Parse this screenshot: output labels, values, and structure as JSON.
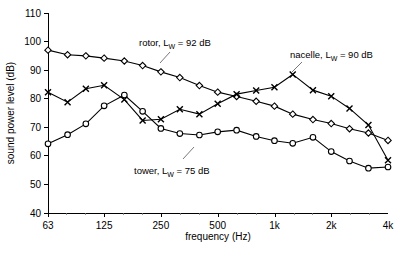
{
  "chart_data": {
    "type": "line",
    "title": "",
    "xlabel": "frequency (Hz)",
    "ylabel": "sound power level (dB)",
    "xscale": "log",
    "xlim": [
      63,
      4000
    ],
    "ylim": [
      40,
      110
    ],
    "grid": false,
    "legend_position": "inline-annotations",
    "xtick_labels": [
      "63",
      "125",
      "250",
      "500",
      "1k",
      "2k",
      "4k"
    ],
    "xtick_values": [
      63,
      125,
      250,
      500,
      1000,
      2000,
      4000
    ],
    "ytick_labels": [
      "40",
      "50",
      "60",
      "70",
      "80",
      "90",
      "100",
      "110"
    ],
    "ytick_values": [
      40,
      50,
      60,
      70,
      80,
      90,
      100,
      110
    ],
    "x": [
      63,
      80,
      100,
      125,
      160,
      200,
      250,
      315,
      400,
      500,
      630,
      800,
      1000,
      1250,
      1600,
      2000,
      2500,
      3150,
      4000
    ],
    "series": [
      {
        "name": "rotor",
        "marker": "diamond",
        "label": "rotor, L",
        "label_sub": "W",
        "label_tail": " = 92 dB",
        "lw_db": 92,
        "values": [
          97.0,
          95.4,
          95.0,
          94.2,
          93.2,
          91.6,
          89.4,
          87.4,
          84.6,
          82.3,
          80.8,
          79.1,
          77.4,
          74.6,
          72.7,
          71.3,
          69.5,
          68.0,
          65.4
        ]
      },
      {
        "name": "nacelle",
        "marker": "x",
        "label": "nacelle, L",
        "label_sub": "W",
        "label_tail": " = 90 dB",
        "lw_db": 90,
        "values": [
          82.3,
          78.8,
          83.5,
          84.7,
          79.7,
          72.4,
          72.8,
          76.3,
          74.6,
          78.2,
          81.6,
          82.9,
          84.0,
          88.5,
          83.0,
          80.9,
          76.6,
          70.8,
          58.5
        ]
      },
      {
        "name": "tower",
        "marker": "circle",
        "label": "tower, L",
        "label_sub": "W",
        "label_tail": " = 75 dB",
        "lw_db": 75,
        "values": [
          64.2,
          67.4,
          71.2,
          77.5,
          81.3,
          75.6,
          69.6,
          67.8,
          67.3,
          68.4,
          69.0,
          66.8,
          65.3,
          64.4,
          65.8,
          69.3,
          66.5,
          64.4,
          64.6
        ]
      }
    ],
    "series_extra_note": "tower extends to 4k with additional declining tail",
    "tower_tail_x": [
      1600,
      2000,
      2500,
      3150,
      4000
    ],
    "tower_tail_values": [
      66.5,
      61.5,
      58.2,
      55.7,
      56.1
    ]
  },
  "annotations": [
    {
      "id": "rotor-label",
      "text_main": "rotor, L",
      "text_sub": "W",
      "text_tail": " = 92 dB"
    },
    {
      "id": "nacelle-label",
      "text_main": "nacelle, L",
      "text_sub": "W",
      "text_tail": " = 90 dB"
    },
    {
      "id": "tower-label",
      "text_main": "tower, L",
      "text_sub": "W",
      "text_tail": " = 75 dB"
    }
  ],
  "colors": {
    "axis": "#000000",
    "series": "#000000",
    "background": "#ffffff"
  }
}
